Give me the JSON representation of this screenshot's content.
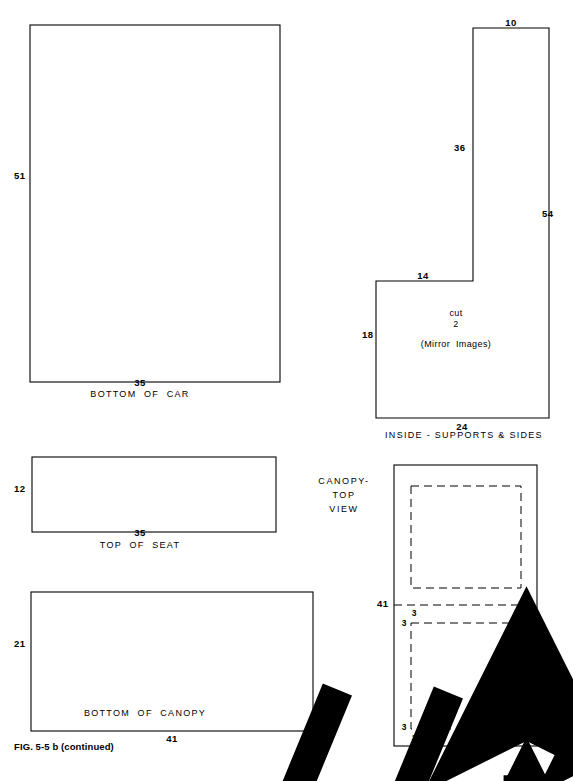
{
  "figure": {
    "caption": "FIG. 5-5 b (continued)",
    "page_width": 573,
    "page_height": 781,
    "line_color": "#000000",
    "background_color": "#ffffff"
  },
  "icons": {
    "grain_arrow": "grain-direction-arrow-icon"
  },
  "parts": [
    {
      "id": "bottom-of-car",
      "title": "BOTTOM  OF  CAR",
      "shape": "rectangle",
      "dimensions": {
        "height_label": "51",
        "width_label": "35"
      },
      "grain_arrow": true
    },
    {
      "id": "inside-supports-and-sides",
      "title": "INSIDE - SUPPORTS & SIDES",
      "shape": "l-shape",
      "note_cut": "cut",
      "note_qty": "2",
      "note_mirror": "(Mirror  Images)",
      "dimensions": {
        "top_label": "10",
        "inner_vertical_label": "36",
        "right_vertical_label": "54",
        "step_top_label": "14",
        "left_vertical_label": "18",
        "bottom_label": "24"
      },
      "grain_arrow": true
    },
    {
      "id": "top-of-seat",
      "title": "TOP  OF  SEAT",
      "shape": "rectangle",
      "dimensions": {
        "height_label": "12",
        "width_label": "35"
      },
      "grain_arrow": true
    },
    {
      "id": "bottom-of-canopy",
      "title": "BOTTOM  OF  CANOPY",
      "shape": "rectangle",
      "dimensions": {
        "height_label": "21",
        "width_label": "41"
      },
      "grain_arrow": true
    },
    {
      "id": "canopy-top-view",
      "title_line1": "CANOPY-",
      "title_line2": "TOP",
      "title_line3": "VIEW",
      "shape": "rectangle-with-two-dashed-panels",
      "dimensions": {
        "height_label": "41",
        "width_label": "21"
      },
      "inset_labels": {
        "upper_left_outer": "3",
        "upper_left_inner": "3",
        "upper_right_outer": "3",
        "upper_right_inner": "3",
        "lower_left_outer": "3",
        "lower_left_inner": "3",
        "lower_right_outer": "3",
        "lower_right_inner": "3"
      },
      "grain_arrow": true
    }
  ]
}
